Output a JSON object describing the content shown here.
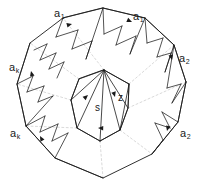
{
  "figure": {
    "background_color": "#ffffff",
    "stroke_color": "#1a1a1a",
    "dotted_color": "#cccccc",
    "width": 204,
    "height": 194
  },
  "labels": {
    "a1_left": {
      "base": "a",
      "sub": "1",
      "x": 54,
      "y": 8
    },
    "a1_right": {
      "base": "a",
      "sub": "1",
      "x": 133,
      "y": 11
    },
    "a2_upper": {
      "base": "a",
      "sub": "2",
      "x": 179,
      "y": 53
    },
    "a2_lower": {
      "base": "a",
      "sub": "2",
      "x": 180,
      "y": 128
    },
    "ak_upper": {
      "base": "a",
      "sub": "k",
      "x": 9,
      "y": 62
    },
    "ak_lower": {
      "base": "a",
      "sub": "k",
      "x": 10,
      "y": 128
    },
    "s": {
      "text": "s",
      "x": 95,
      "y": 103
    },
    "z": {
      "text": "z",
      "x": 118,
      "y": 93
    }
  },
  "geometry": {
    "outer_polygon": "103,8 145,18 174,45 186,82 178,122 152,154 103,178 55,158 26,126 17,84 30,43 63,18",
    "inner_polygon": "104,70 129,84 128,108 120,130 100,141 77,128 71,100 79,79",
    "outer_band_paths": [
      "M63,18 L103,8 L145,18",
      "M145,18 L174,45 L186,82",
      "M186,82 L178,122 L152,154",
      "M30,43 L17,84 L26,126",
      "M26,126 L55,158 L103,178"
    ],
    "inner_band_paths": [
      "M79,79 L104,70 L129,84",
      "M129,84 L128,108 L120,130",
      "M71,100 L77,128 L100,141"
    ],
    "triangulation_edges": [
      "M34,50 L47,44",
      "M47,44 L40,60",
      "M40,60 L56,53",
      "M56,53 L49,69",
      "M49,69 L64,62",
      "M64,62 L57,78",
      "M63,18 L56,37",
      "M56,37 L78,30",
      "M78,30 L72,49",
      "M72,49 L92,41",
      "M92,41 L86,59",
      "M86,59 L103,8",
      "M103,8 L104,34",
      "M104,34 L122,26",
      "M122,26 L116,45",
      "M116,45 L136,36",
      "M136,36 L130,54",
      "M130,54 L145,18",
      "M145,18 L147,43",
      "M147,43 L163,38",
      "M163,38 L157,57",
      "M157,57 L171,53",
      "M171,53 L165,72",
      "M165,72 L174,45",
      "M174,45 L167,88",
      "M167,88 L181,84",
      "M181,84 L172,103",
      "M172,103 L186,82",
      "M178,122 L162,112",
      "M162,112 L170,128",
      "M170,128 L155,123",
      "M155,123 L163,140",
      "M163,140 L152,154",
      "M17,84 L33,76",
      "M33,76 L27,92",
      "M27,92 L44,86",
      "M44,86 L38,102",
      "M38,102 L53,96",
      "M53,96 L26,126",
      "M26,126 L45,116",
      "M45,116 L40,132",
      "M40,132 L58,124",
      "M58,124 L52,141",
      "M52,141 L68,133",
      "M68,133 L55,158"
    ],
    "inner_diagonals": [
      "M104,70 L71,100",
      "M104,70 L77,128",
      "M104,70 L100,141",
      "M104,70 L120,130",
      "M129,84 L120,130",
      "M104,70 L128,108",
      "M79,79 L71,100",
      "M120,130 L100,141"
    ],
    "dotted_rays": [
      "M104,70 L63,18",
      "M129,84 L174,45",
      "M128,108 L186,82",
      "M120,130 L152,154",
      "M100,141 L103,178",
      "M71,100 L17,84",
      "M77,128 L26,126",
      "M79,79 L30,43"
    ]
  },
  "arrows": [
    {
      "name": "arrow-a1-left",
      "x": 72,
      "y": 24,
      "angle": -14
    },
    {
      "name": "arrow-a1-right",
      "x": 132,
      "y": 22,
      "angle": 24
    },
    {
      "name": "arrow-a2-upper",
      "x": 172,
      "y": 60,
      "angle": 76
    },
    {
      "name": "arrow-a2-lower",
      "x": 167,
      "y": 131,
      "angle": 104
    },
    {
      "name": "arrow-ak-upper",
      "x": 31,
      "y": 71,
      "angle": -104
    },
    {
      "name": "arrow-ak-lower",
      "x": 40,
      "y": 136,
      "angle": -118
    },
    {
      "name": "arrow-s",
      "x": 88,
      "y": 95,
      "angle": -42
    },
    {
      "name": "arrow-z",
      "x": 115,
      "y": 97,
      "angle": 74
    },
    {
      "name": "arrow-inner-bottom",
      "x": 98,
      "y": 128,
      "angle": 182
    }
  ]
}
